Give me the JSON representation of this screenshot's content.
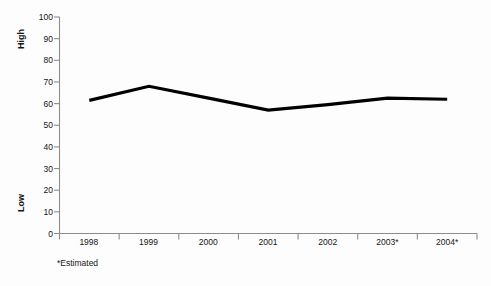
{
  "chart_data": {
    "type": "line",
    "title": "",
    "subtitle": "",
    "xlabel": "",
    "ylabel": "",
    "categories": [
      "1998",
      "1999",
      "2000",
      "2001",
      "2002",
      "2003*",
      "2004*"
    ],
    "values": [
      61.5,
      68,
      62.5,
      57,
      59.5,
      62.5,
      62
    ],
    "series": [
      {
        "name": "",
        "values": [
          61.5,
          68,
          62.5,
          57,
          59.5,
          62.5,
          62
        ]
      }
    ],
    "ylim": [
      0,
      100
    ],
    "yticks": [
      0,
      10,
      20,
      30,
      40,
      50,
      60,
      70,
      80,
      90,
      100
    ],
    "ytick_labels": [
      "0",
      "10",
      "20",
      "30",
      "40",
      "50",
      "60",
      "70",
      "80",
      "90",
      "100"
    ],
    "grid": false,
    "legend": "none",
    "line_color": "#000000",
    "axis_color": "#8c8c8c",
    "background_color": "#fdfdfd",
    "annotations": {
      "y_axis_top_caption": "High",
      "y_axis_bottom_caption": "Low",
      "footnote": "*Estimated"
    }
  }
}
